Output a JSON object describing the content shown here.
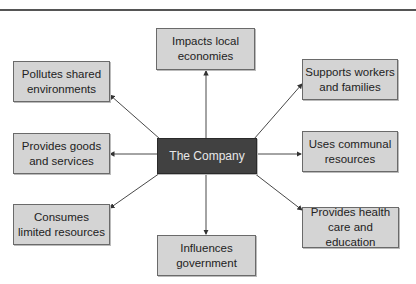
{
  "diagram": {
    "center": {
      "label": "The Company"
    },
    "nodes": [
      {
        "id": "top",
        "label": "Impacts local\neconomies"
      },
      {
        "id": "top-left",
        "label": "Pollutes shared\nenvironments"
      },
      {
        "id": "top-right",
        "label": "Supports workers\nand families"
      },
      {
        "id": "left",
        "label": "Provides goods\nand services"
      },
      {
        "id": "right",
        "label": "Uses communal\nresources"
      },
      {
        "id": "bottom-left",
        "label": "Consumes\nlimited resources"
      },
      {
        "id": "bottom",
        "label": "Influences\ngovernment"
      },
      {
        "id": "bottom-right",
        "label": "Provides health\ncare and education"
      }
    ],
    "colors": {
      "node_fill": "#d4d4d4",
      "center_fill": "#414141",
      "arrow": "#333333"
    }
  }
}
